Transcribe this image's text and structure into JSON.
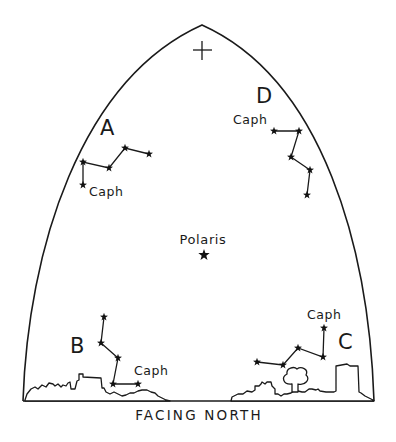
{
  "figure": {
    "caption": "FACING NORTH",
    "zenith_marker": "+",
    "polaris": {
      "label": "Polaris",
      "x": 204,
      "y": 255
    }
  },
  "constellations": [
    {
      "id": "A",
      "label": "A",
      "label_pos": [
        107,
        135
      ],
      "caph_label": "Caph",
      "caph_label_pos": [
        88,
        196
      ],
      "stars": [
        [
          149,
          154
        ],
        [
          125,
          148
        ],
        [
          109,
          168
        ],
        [
          83,
          162
        ],
        [
          83,
          185
        ]
      ],
      "caph_index": 4
    },
    {
      "id": "D",
      "label": "D",
      "label_pos": [
        263,
        103
      ],
      "caph_label": "Caph",
      "caph_label_pos": [
        233,
        124
      ],
      "stars": [
        [
          274,
          131
        ],
        [
          299,
          131
        ],
        [
          291,
          157
        ],
        [
          310,
          170
        ],
        [
          307,
          195
        ]
      ],
      "caph_index": 0
    },
    {
      "id": "B",
      "label": "B",
      "label_pos": [
        78,
        353
      ],
      "caph_label": "Caph",
      "caph_label_pos": [
        135,
        375
      ],
      "stars": [
        [
          104,
          317
        ],
        [
          101,
          343
        ],
        [
          118,
          358
        ],
        [
          113,
          384
        ],
        [
          138,
          384
        ]
      ],
      "caph_index": 4
    },
    {
      "id": "C",
      "label": "C",
      "label_pos": [
        346,
        349
      ],
      "caph_label": "Caph",
      "caph_label_pos": [
        325,
        319
      ],
      "stars": [
        [
          324,
          328
        ],
        [
          323,
          357
        ],
        [
          298,
          348
        ],
        [
          283,
          365
        ],
        [
          257,
          362
        ]
      ],
      "caph_index": 0
    }
  ],
  "labels": {
    "A": "A",
    "B": "B",
    "C": "C",
    "D": "D",
    "caph": "Caph",
    "polaris": "Polaris",
    "caption": "FACING NORTH",
    "zenith": "+"
  }
}
